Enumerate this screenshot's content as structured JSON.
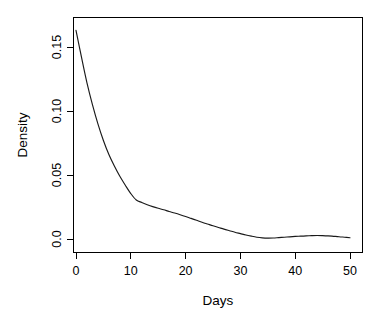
{
  "chart_data": {
    "type": "line",
    "title": "",
    "xlabel": "Days",
    "ylabel": "Density",
    "xlim": [
      0,
      50
    ],
    "ylim": [
      0.0,
      0.165
    ],
    "grid": false,
    "legend": false,
    "legend_position": "none",
    "x_ticks": [
      0,
      10,
      20,
      30,
      40,
      50
    ],
    "x_tick_labels": [
      "0",
      "10",
      "20",
      "30",
      "40",
      "50"
    ],
    "y_ticks": [
      0.0,
      0.05,
      0.1,
      0.15
    ],
    "y_tick_labels": [
      "0.0",
      "0.05",
      "0.10",
      "0.15"
    ],
    "series": [
      {
        "name": "Density",
        "color": "#1a1a1a",
        "x": [
          0,
          1,
          2,
          3,
          4,
          5,
          6,
          7,
          8,
          9,
          10,
          11,
          12,
          13,
          14,
          15,
          16,
          17,
          18,
          19,
          20,
          21,
          22,
          23,
          24,
          25,
          26,
          27,
          28,
          29,
          30,
          31,
          32,
          33,
          34,
          35,
          36,
          37,
          38,
          39,
          40,
          41,
          42,
          43,
          44,
          45,
          46,
          47,
          48,
          49,
          50
        ],
        "values": [
          0.163,
          0.142,
          0.122,
          0.105,
          0.09,
          0.077,
          0.066,
          0.057,
          0.049,
          0.042,
          0.0355,
          0.0305,
          0.0285,
          0.0268,
          0.0253,
          0.024,
          0.0228,
          0.0215,
          0.0203,
          0.019,
          0.0176,
          0.0161,
          0.0146,
          0.0131,
          0.0117,
          0.0103,
          0.009,
          0.0077,
          0.0065,
          0.0053,
          0.0042,
          0.0031,
          0.0022,
          0.0014,
          0.0009,
          0.0007,
          0.0008,
          0.0011,
          0.0014,
          0.0017,
          0.002,
          0.0022,
          0.0024,
          0.0026,
          0.0027,
          0.0026,
          0.0024,
          0.0021,
          0.0018,
          0.0014,
          0.001
        ]
      }
    ]
  },
  "axes": {
    "x_title": "Days",
    "y_title": "Density"
  }
}
